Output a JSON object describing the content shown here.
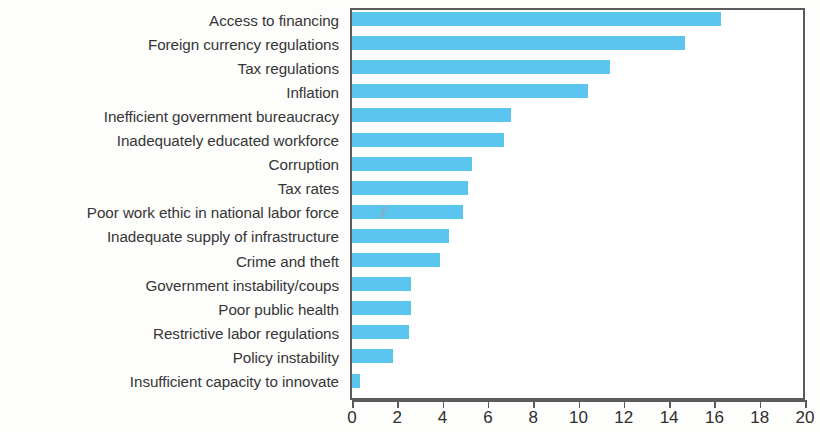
{
  "chart_data": {
    "type": "bar",
    "orientation": "horizontal",
    "title": "",
    "subtitle": "",
    "xlabel": "",
    "ylabel": "",
    "xlim": [
      0,
      20
    ],
    "ylim": null,
    "grid": false,
    "legend": null,
    "legend_position": "none",
    "bar_color": "#5bc5ef",
    "axis_color": "#5b5b5b",
    "label_color": "#363636",
    "xticks": [
      0,
      2,
      4,
      6,
      8,
      10,
      12,
      14,
      16,
      18,
      20
    ],
    "xtick_labels": [
      "0",
      "2",
      "4",
      "6",
      "8",
      "10",
      "12",
      "14",
      "16",
      "18",
      "20"
    ],
    "categories": [
      "Access to financing",
      "Foreign currency regulations",
      "Tax regulations",
      "Inflation",
      "Inefficient government bureaucracy",
      "Inadequately educated workforce",
      "Corruption",
      "Tax rates",
      "Poor work ethic in national labor force",
      "Inadequate supply of infrastructure",
      "Crime and theft",
      "Government instability/coups",
      "Poor public health",
      "Restrictive labor regulations",
      "Policy instability",
      "Insufficient capacity to innovate"
    ],
    "values": [
      16.3,
      14.7,
      11.4,
      10.4,
      7.0,
      6.7,
      5.3,
      5.1,
      4.9,
      4.3,
      3.9,
      2.6,
      2.6,
      2.5,
      1.8,
      0.35
    ]
  }
}
